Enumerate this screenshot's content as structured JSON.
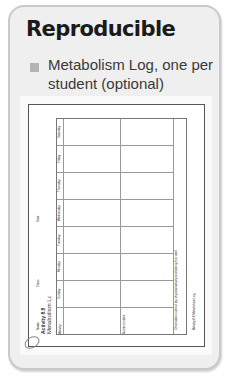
{
  "card": {
    "heading": "Reproducible",
    "items": [
      {
        "label": "Metabolism Log, one per student (optional)"
      }
    ]
  },
  "document": {
    "title": "Activity 8.8",
    "subtitle": "Metabolism Log",
    "fields": {
      "name": "Name",
      "class": "Class",
      "date": "Date"
    },
    "days": [
      "Saturday",
      "Friday",
      "Thursday",
      "Wednesday",
      "Tuesday",
      "Monday",
      "Sunday"
    ],
    "row_labels": [
      "Activity",
      "Nutrient intake"
    ],
    "observations_prompt": "Observations about my physical activity and eating this week",
    "footer": "Activity 8.8 Metabolism Log"
  },
  "colors": {
    "card_bg": "#efefef",
    "card_border": "#c9c9c9",
    "bullet": "#b3b3b3"
  }
}
